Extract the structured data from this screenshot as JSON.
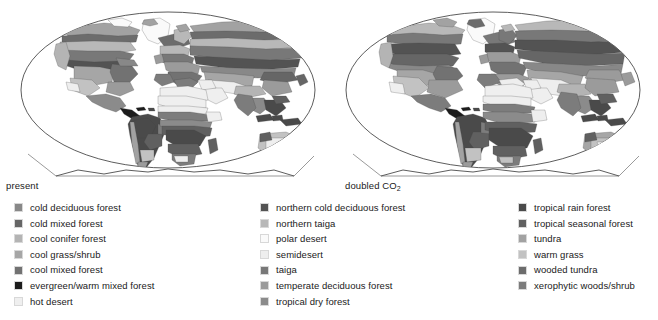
{
  "figure": {
    "background_color": "#ffffff",
    "outline_color": "#222222"
  },
  "panels": [
    {
      "id": "present",
      "caption": "present",
      "caption_sub": "",
      "projection": "elliptical-pseudocylindrical"
    },
    {
      "id": "doubled",
      "caption": "doubled CO",
      "caption_sub": "2",
      "projection": "elliptical-pseudocylindrical"
    }
  ],
  "legend": {
    "columns": [
      {
        "id": "column-1",
        "items": [
          {
            "label": "cold deciduous forest",
            "color": "#888888"
          },
          {
            "label": "cold mixed forest",
            "color": "#666666"
          },
          {
            "label": "cool conifer forest",
            "color": "#b4b4b4"
          },
          {
            "label": "cool grass/shrub",
            "color": "#a6a6a6"
          },
          {
            "label": "cool mixed forest",
            "color": "#727272"
          },
          {
            "label": "evergreen/warm mixed forest",
            "color": "#1c1c1c"
          },
          {
            "label": "hot desert",
            "color": "#efefef"
          }
        ]
      },
      {
        "id": "column-2",
        "items": [
          {
            "label": "northern cold deciduous forest",
            "color": "#535353"
          },
          {
            "label": "northern taiga",
            "color": "#b8b8b8"
          },
          {
            "label": "polar desert",
            "color": "#fafafa"
          },
          {
            "label": "semidesert",
            "color": "#eeeeee"
          },
          {
            "label": "taiga",
            "color": "#787878"
          },
          {
            "label": "temperate deciduous forest",
            "color": "#9b9b9b"
          },
          {
            "label": "tropical dry forest",
            "color": "#8b8b8b"
          }
        ]
      },
      {
        "id": "column-3",
        "items": [
          {
            "label": "tropical rain forest",
            "color": "#4a4a4a"
          },
          {
            "label": "tropical seasonal forest",
            "color": "#606060"
          },
          {
            "label": "tundra",
            "color": "#a2a2a2"
          },
          {
            "label": "warm grass",
            "color": "#c2c2c2"
          },
          {
            "label": "wooded tundra",
            "color": "#6c6c6c"
          },
          {
            "label": "xerophytic woods/shrub",
            "color": "#7c7c7c"
          }
        ]
      }
    ]
  }
}
